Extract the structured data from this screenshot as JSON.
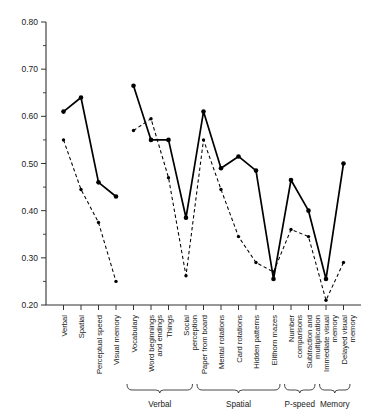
{
  "chart_data": {
    "type": "line",
    "title": "",
    "subtitle": "",
    "xlabel": "",
    "ylabel": "",
    "ylim": [
      0.2,
      0.8
    ],
    "ytick_labels": [
      "0.20",
      "0.30",
      "0.40",
      "0.50",
      "0.60",
      "0.70",
      "0.80"
    ],
    "ytick_values": [
      0.2,
      0.3,
      0.4,
      0.5,
      0.6,
      0.7,
      0.8
    ],
    "yminor_step": 0.05,
    "grid": false,
    "legend_position": "none",
    "categories": [
      "Verbal",
      "Spatial",
      "Perceptual speed",
      "Visual memory",
      "Vocabulary",
      "Word beginnings and endings",
      "Things",
      "Social perception",
      "Paper from board",
      "Mental rotations",
      "Card rotations",
      "Hidden patterns",
      "Elithorn mazes",
      "Number comparisons",
      "Subtraction and multiplication",
      "Immediate visual memory",
      "Delayed visual memory"
    ],
    "series": [
      {
        "name": "solid",
        "style": "solid",
        "values": [
          0.61,
          0.64,
          0.46,
          0.43,
          0.665,
          0.55,
          0.55,
          0.385,
          0.61,
          0.49,
          0.515,
          0.485,
          0.255,
          0.465,
          0.4,
          0.255,
          0.5
        ],
        "segments": [
          [
            0,
            3
          ],
          [
            4,
            16
          ]
        ]
      },
      {
        "name": "dashed",
        "style": "dashed",
        "values": [
          0.55,
          0.445,
          0.375,
          0.25,
          0.57,
          0.595,
          0.47,
          0.262,
          0.55,
          0.445,
          0.345,
          0.29,
          0.27,
          0.36,
          0.345,
          0.21,
          0.29
        ],
        "segments": [
          [
            0,
            3
          ],
          [
            4,
            16
          ]
        ]
      }
    ],
    "groups": [
      {
        "label": "Verbal",
        "start": 4,
        "end": 7
      },
      {
        "label": "Spatial",
        "start": 8,
        "end": 12
      },
      {
        "label": "P-speed",
        "start": 13,
        "end": 14
      },
      {
        "label": "Memory",
        "start": 15,
        "end": 16
      }
    ]
  }
}
